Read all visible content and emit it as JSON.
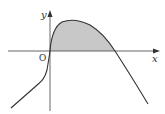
{
  "figure": {
    "type": "function-graph",
    "axes": {
      "x_label": "x",
      "y_label": "y",
      "origin_label": "O"
    },
    "curve": {
      "description": "curve rising through origin to a maximum, then crossing x-axis and descending",
      "stroke_color": "#333333"
    },
    "shaded_region": {
      "description": "area between curve and x-axis from origin to x-intercept",
      "fill_color": "#c8c8c8"
    }
  }
}
